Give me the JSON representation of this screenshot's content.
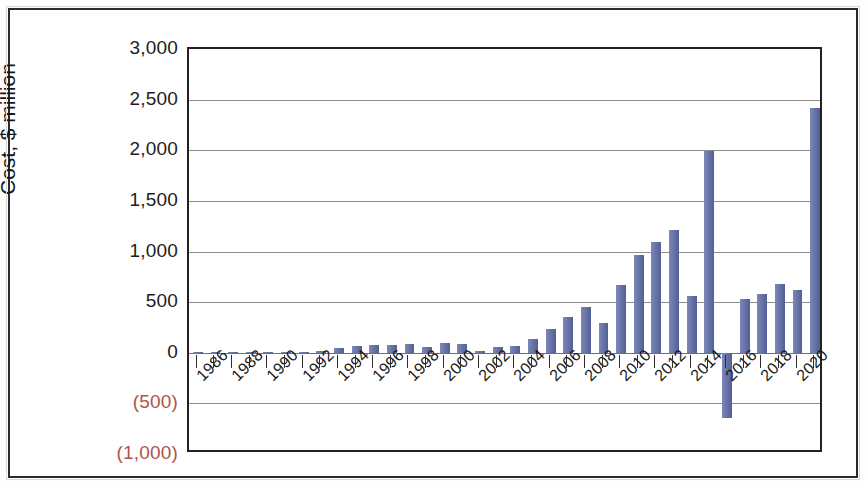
{
  "chart_data": {
    "type": "bar",
    "title": "",
    "xlabel": "",
    "ylabel": "Cost, $ million",
    "ylim": [
      -1000,
      3000
    ],
    "ytick_values": [
      3000,
      2500,
      2000,
      1500,
      1000,
      500,
      0,
      -500,
      -1000
    ],
    "ytick_labels": [
      "3,000",
      "2,500",
      "2,000",
      "1,500",
      "1,000",
      "500",
      "0",
      "(500)",
      "(1,000)"
    ],
    "negative_tick_labels": [
      "(500)",
      "(1,000)"
    ],
    "grid": true,
    "grid_axis": "y",
    "legend": false,
    "bar_color": "#5b6aa5",
    "negative_label_color": "#b0544a",
    "axis_text_color": "#171717",
    "categories": [
      "1986",
      "1987",
      "1988",
      "1989",
      "1990",
      "1991",
      "1992",
      "1993",
      "1994",
      "1995",
      "1996",
      "1997",
      "1998",
      "1999",
      "2000",
      "2001",
      "2002",
      "2003",
      "2004",
      "2005",
      "2006",
      "2007",
      "2008",
      "2009",
      "2010",
      "2011",
      "2012",
      "2013",
      "2014",
      "2015",
      "2016",
      "2017",
      "2018",
      "2019",
      "2020",
      "2021"
    ],
    "xtick_labels_shown": [
      "1986",
      "1988",
      "1990",
      "1992",
      "1994",
      "1996",
      "1998",
      "2000",
      "2002",
      "2004",
      "2006",
      "2008",
      "2010",
      "2012",
      "2014",
      "2016",
      "2018",
      "2020"
    ],
    "values": [
      3,
      5,
      6,
      5,
      8,
      6,
      10,
      18,
      48,
      62,
      78,
      80,
      88,
      60,
      92,
      90,
      18,
      60,
      62,
      140,
      230,
      350,
      455,
      295,
      665,
      965,
      1090,
      1215,
      560,
      1990,
      -640,
      530,
      580,
      680,
      615,
      1195
    ],
    "peak_value": 2420,
    "peak_category": "2021",
    "min_value": -640,
    "min_category": "2016"
  }
}
